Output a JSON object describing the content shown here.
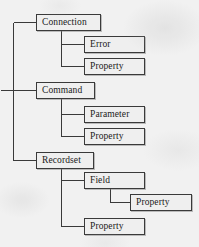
{
  "diagram": {
    "type": "tree",
    "style": {
      "background_color": "#f1f1f1",
      "node_fill": "#efefef",
      "node_border": "#3a3a3a",
      "edge_color": "#3a3a3a",
      "text_color": "#1b1b1b"
    },
    "nodes": [
      {
        "id": "connection",
        "label": "Connection",
        "x": 36,
        "y": 14,
        "w": 65,
        "h": 17
      },
      {
        "id": "conn_error",
        "label": "Error",
        "x": 84,
        "y": 36,
        "w": 61,
        "h": 17
      },
      {
        "id": "conn_property",
        "label": "Property",
        "x": 84,
        "y": 58,
        "w": 61,
        "h": 17
      },
      {
        "id": "command",
        "label": "Command",
        "x": 36,
        "y": 82,
        "w": 59,
        "h": 17
      },
      {
        "id": "cmd_parameter",
        "label": "Parameter",
        "x": 84,
        "y": 106,
        "w": 61,
        "h": 17
      },
      {
        "id": "cmd_property",
        "label": "Property",
        "x": 84,
        "y": 128,
        "w": 61,
        "h": 17
      },
      {
        "id": "recordset",
        "label": "Recordset",
        "x": 36,
        "y": 152,
        "w": 58,
        "h": 17
      },
      {
        "id": "rs_field",
        "label": "Field",
        "x": 84,
        "y": 172,
        "w": 61,
        "h": 17
      },
      {
        "id": "field_property",
        "label": "Property",
        "x": 130,
        "y": 194,
        "w": 62,
        "h": 17
      },
      {
        "id": "rs_property",
        "label": "Property",
        "x": 84,
        "y": 218,
        "w": 61,
        "h": 17
      }
    ],
    "edges": [
      {
        "from": "root-trunk",
        "to": "connection",
        "path": "M13,22 L36,22"
      },
      {
        "from": "root-trunk",
        "to": "trunk-vertical",
        "path": "M13,22 L13,160"
      },
      {
        "from": "root-trunk",
        "to": "root-stub",
        "path": "M0,90 L13,90"
      },
      {
        "from": "root-trunk",
        "to": "command",
        "path": "M13,90 L36,90"
      },
      {
        "from": "root-trunk",
        "to": "recordset",
        "path": "M13,160 L36,160"
      },
      {
        "from": "connection",
        "to": "conn-branch",
        "path": "M61,31 L61,66"
      },
      {
        "from": "conn-branch",
        "to": "conn_error",
        "path": "M61,44 L84,44"
      },
      {
        "from": "conn-branch",
        "to": "conn_property",
        "path": "M61,66 L84,66"
      },
      {
        "from": "command",
        "to": "cmd-branch",
        "path": "M61,99 L61,136"
      },
      {
        "from": "cmd-branch",
        "to": "cmd_parameter",
        "path": "M61,114 L84,114"
      },
      {
        "from": "cmd-branch",
        "to": "cmd_property",
        "path": "M61,136 L84,136"
      },
      {
        "from": "recordset",
        "to": "rs-branch",
        "path": "M61,169 L61,226"
      },
      {
        "from": "rs-branch",
        "to": "rs_field",
        "path": "M61,180 L84,180"
      },
      {
        "from": "rs-branch",
        "to": "rs_property",
        "path": "M61,226 L84,226"
      },
      {
        "from": "rs_field",
        "to": "field-branch",
        "path": "M110,189 L110,202"
      },
      {
        "from": "field-branch",
        "to": "field_property",
        "path": "M110,202 L130,202"
      }
    ]
  }
}
